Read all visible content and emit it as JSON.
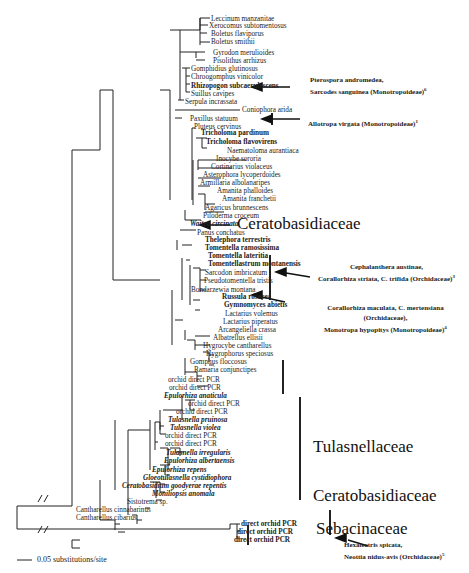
{
  "figure": {
    "scale_bar": "0.05 substitutions/site",
    "families": [
      {
        "id": "cerato1",
        "label": "Ceratobasidiaceae"
      },
      {
        "id": "tulas",
        "label": "Tulasnellaceae"
      },
      {
        "id": "cerato2",
        "label": "Ceratobasidiaceae"
      },
      {
        "id": "sebac",
        "label": "Sebacinaceae"
      }
    ],
    "taxa": [
      "Leccinum manzanitae",
      "Xerocomus subtomentosus",
      "Boletus flaviporus",
      "Boletus smithii",
      "Gyrodon merulioides",
      "Pisolithus arrhizus",
      "Gomphidius glutinosus",
      "Chroogomphus vinicolor",
      "Rhizopogon   subcaerulescens",
      "Suillus cavipes",
      "Serpula incrassata",
      "Coniophora arida",
      "Paxillus statuum",
      "Pluteus cervinus",
      "Tricholoma pardinum",
      "Tricholoma flavovirens",
      "Naematoloma aurantiaca",
      "Inocybe sororia",
      "Cortinarius violaceus",
      "Asterophora lycoperdoides",
      "Armillaria albolanaripes",
      "Amanita phalloides",
      "Amanita franchetii",
      "Agaricus brunnescens",
      "Piloderma croceum",
      "Waitea circinata",
      "Panus conchatus",
      "Thelephora terrestris",
      "Tomentella ramosissima",
      "Tomentella lateritia",
      "Tomentellastrum montanensis",
      "Sarcodon imbricatum",
      "Pseudotomentella tristis",
      "Bondarzewia montana",
      "Russula  rosacea",
      "Gymnomyces  abietis",
      "Lactarius volemus",
      "Lactarius piperatus",
      "Arcangeliella crassa",
      "Albatrellus ellisii",
      "Hygrocybe cantharellus",
      "Hygrophorus speciosus",
      "Gomphus floccosus",
      "Ramaria conjunctipes",
      "orchid direct PCR",
      "orchid direct PCR",
      "Epulorhiza anaticula",
      "orchid direct PCR",
      "orchid direct PCR",
      "Tulasnella pruinosa",
      "Tulasnella violea",
      "orchid direct PCR",
      "orchid direct PCR",
      "Tulasnella irregularis",
      "Epulorhiza albertaensis",
      "Epulorhiza repens",
      "Gloeotulasnella cystidiophora",
      "Ceratobasidium goodyerae repentis",
      "Moniliopsis anomala",
      "Sistotrema sp.",
      "Cantharellus cinnabarinus",
      "Cantharellus cibarius",
      "direct orchid   PCR",
      "direct orchid   PCR",
      "direct orchid   PCR"
    ],
    "annotations": {
      "monotropoid6_l1": "Pterospora andromedea,",
      "monotropoid6_l2": "Sarcodes sanguinea (Monotropoideae)",
      "monotropoid6_sup": "6",
      "allotropa": "Allotropa virgata (Monotropoideae)",
      "allotropa_sup": "1",
      "ceph_l1": "Cephalanthera austinae,",
      "ceph_l2": "Corallorhiza striata, C. trifida (Orchidaceae)",
      "ceph_sup": "3",
      "coral_l1": "Corallorhiza maculata, C. mertensiana",
      "coral_l2": "(Orchidaceae),",
      "coral_l3": "Monotropa hypopitys (Monotropoideae)",
      "coral_sup": "4",
      "hexa_l1": "Hexalectris spicata,",
      "hexa_l2": "Neottia nidus-avis (Orchidaceae)",
      "hexa_sup": "5"
    }
  }
}
